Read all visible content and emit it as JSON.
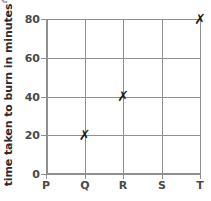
{
  "clipped_top_glyph": "c",
  "chart_data": {
    "type": "scatter",
    "title": "",
    "xlabel": "",
    "ylabel": "time taken to burn in minutes",
    "categories": [
      "P",
      "Q",
      "R",
      "S",
      "T"
    ],
    "ytick_labels": [
      "0",
      "20",
      "40",
      "60",
      "80"
    ],
    "ytick_values": [
      0,
      20,
      40,
      60,
      80
    ],
    "ylim": [
      0,
      80
    ],
    "grid": true,
    "legend": "none",
    "marker_symbol": "✗",
    "marker_color": "#1c1c1c",
    "grid_color": "#8f8f8f",
    "axis_color": "#8f8f8f",
    "label_color": "#4a4a4a",
    "title_color": "#2b2b2b",
    "points": [
      {
        "category": "Q",
        "value": 20,
        "label": "20"
      },
      {
        "category": "R",
        "value": 40,
        "label": "40"
      },
      {
        "category": "T",
        "value": 80,
        "label": "80"
      }
    ]
  }
}
